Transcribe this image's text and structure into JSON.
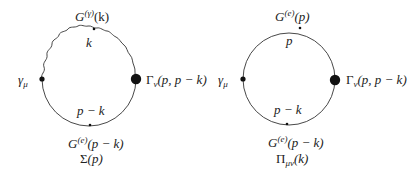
{
  "diagrams": [
    {
      "name": "Sigma(p)",
      "caption": {
        "symbol": "Σ",
        "arg": "(p)"
      },
      "top_propagator": {
        "base": "G",
        "sup": "(γ)",
        "arg": "(k)",
        "type": "photon-wavy"
      },
      "top_momentum": "k",
      "bottom_propagator": {
        "base": "G",
        "sup": "(e)",
        "arg": "(p − k)",
        "type": "electron"
      },
      "bottom_momentum": "p − k",
      "left_vertex": {
        "base": "γ",
        "sub": "μ"
      },
      "right_vertex": {
        "base": "Γ",
        "sub": "ν",
        "arg": "(p, p − k)"
      }
    },
    {
      "name": "Pi_munu(k)",
      "caption": {
        "symbol": "Π",
        "sub": "μν",
        "arg": "(k)"
      },
      "top_propagator": {
        "base": "G",
        "sup": "(e)",
        "arg": "(p)",
        "type": "electron"
      },
      "top_momentum": "p",
      "bottom_propagator": {
        "base": "G",
        "sup": "(e)",
        "arg": "(p − k)",
        "type": "electron"
      },
      "bottom_momentum": "p − k",
      "left_vertex": {
        "base": "γ",
        "sub": "μ"
      },
      "right_vertex": {
        "base": "Γ",
        "sub": "ν",
        "arg": "(p, p − k)"
      }
    }
  ],
  "colors": {
    "line": "#333333",
    "dot": "#111111",
    "background": "#ffffff"
  }
}
